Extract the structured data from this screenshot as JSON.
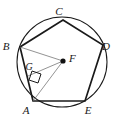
{
  "figure": {
    "stroke_color": "#1a1a1a",
    "helper_line_color": "#6f6f6f",
    "background_color": "#ffffff"
  },
  "circle": {
    "name": "circumscribed-circle",
    "center_x": 62,
    "center_y": 62,
    "radius": 45
  },
  "polygon": {
    "name": "regular-pentagon",
    "sides": 5,
    "vertex_order": "C, D, E, A, B",
    "path": "M 63 20 L 103 45 L 85 101 L 33 101 L 20 47 Z"
  },
  "points": [
    {
      "id": "A",
      "label": "A",
      "x": 33,
      "y": 101,
      "label_x": 26,
      "label_y": 114,
      "role": "pentagon-vertex"
    },
    {
      "id": "B",
      "label": "B",
      "x": 20,
      "y": 47,
      "label_x": 6,
      "label_y": 50,
      "role": "pentagon-vertex"
    },
    {
      "id": "C",
      "label": "C",
      "x": 63,
      "y": 20,
      "label_x": 59,
      "label_y": 15,
      "role": "pentagon-vertex"
    },
    {
      "id": "D",
      "label": "D",
      "x": 103,
      "y": 45,
      "label_x": 106,
      "label_y": 50,
      "role": "pentagon-vertex"
    },
    {
      "id": "E",
      "label": "E",
      "x": 85,
      "y": 101,
      "label_x": 88,
      "label_y": 114,
      "role": "pentagon-vertex"
    },
    {
      "id": "F",
      "label": "F",
      "x": 63,
      "y": 61,
      "label_x": 69,
      "label_y": 62,
      "role": "circle-center"
    },
    {
      "id": "G",
      "label": "G",
      "x": 28,
      "y": 76,
      "label_x": 29,
      "label_y": 70,
      "role": "apothem-foot"
    }
  ],
  "segments": [
    {
      "name": "radius-fb",
      "from": "F",
      "to": "B",
      "path": "M 63 61 L 20 47",
      "style": "thin"
    },
    {
      "name": "radius-fa",
      "from": "F",
      "to": "A",
      "path": "M 63 61 L 33 101",
      "style": "thin"
    },
    {
      "name": "apothem-fg",
      "from": "F",
      "to": "G",
      "path": "M 63 61 L 28 76",
      "style": "thin"
    }
  ],
  "right_angle": {
    "name": "right-angle-at-g",
    "at_point": "G",
    "path": "M 32 71 L 41 74 L 38 83 L 29 80 Z",
    "measure": "90"
  },
  "center_dot": {
    "name": "center-point-f",
    "cx": 63,
    "cy": 61,
    "r": 2.6
  }
}
